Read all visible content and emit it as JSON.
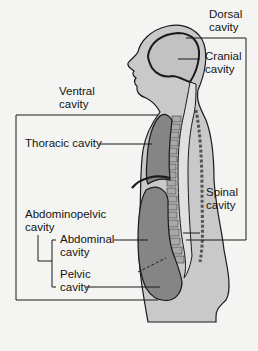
{
  "figure": {
    "labels": {
      "dorsal_cavity": [
        "Dorsal",
        "cavity"
      ],
      "cranial_cavity": [
        "Cranial",
        "cavity"
      ],
      "ventral_cavity": [
        "Ventral",
        "cavity"
      ],
      "thoracic_cavity": "Thoracic cavity",
      "spinal_cavity": [
        "Spinal",
        "cavity"
      ],
      "abdominopelvic_cavity": [
        "Abdominopelvic",
        "cavity"
      ],
      "abdominal_cavity": [
        "Abdominal",
        "cavity"
      ],
      "pelvic_cavity": [
        "Pelvic",
        "cavity"
      ]
    },
    "colors": {
      "background": "#f4f4f2",
      "body_fill": "#c9c9c9",
      "cavity_fill": "#858585",
      "cranial_fill": "#c2c2c2",
      "outline": "#1a1a1a",
      "vertebra_fill": "#a8a8a8"
    }
  }
}
